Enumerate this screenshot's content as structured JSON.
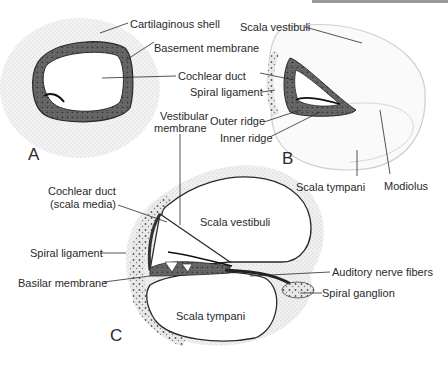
{
  "figure": {
    "panels": [
      {
        "id": "A",
        "label": "A"
      },
      {
        "id": "B",
        "label": "B"
      },
      {
        "id": "C",
        "label": "C"
      }
    ],
    "panel_a": {
      "labels": {
        "cartilaginous_shell": "Cartilaginous shell",
        "basement_membrane": "Basement membrane",
        "cochlear_duct": "Cochlear duct"
      }
    },
    "panel_b": {
      "labels": {
        "scala_vestibuli": "Scala vestibuli",
        "spiral_ligament": "Spiral ligament",
        "outer_ridge": "Outer ridge",
        "inner_ridge": "Inner ridge",
        "scala_tympani": "Scala tympani",
        "modiolus": "Modiolus"
      }
    },
    "panel_c": {
      "labels": {
        "vestibular_membrane_1": "Vestibular",
        "vestibular_membrane_2": "membrane",
        "cochlear_duct_1": "Cochlear duct",
        "cochlear_duct_2": "(scala media)",
        "scala_vestibuli": "Scala vestibuli",
        "spiral_ligament": "Spiral ligament",
        "basilar_membrane": "Basilar membrane",
        "auditory_nerve_fibers": "Auditory nerve fibers",
        "spiral_ganglion": "Spiral ganglion",
        "scala_tympani": "Scala tympani"
      }
    },
    "colors": {
      "ink": "#2a2a2a",
      "stipple": "#d8d8d8",
      "epithelium": "#555555",
      "bar": "#9a9a9a"
    }
  }
}
